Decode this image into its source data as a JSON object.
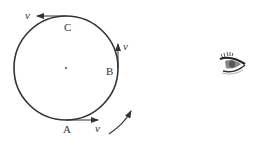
{
  "diagram": {
    "circle": {
      "cx": 66,
      "cy": 68,
      "r": 52,
      "stroke": "#333333"
    },
    "points": [
      {
        "name": "A",
        "label": "A",
        "velocity_label": "v",
        "position": "bottom"
      },
      {
        "name": "B",
        "label": "B",
        "velocity_label": "v",
        "position": "right"
      },
      {
        "name": "C",
        "label": "C",
        "velocity_label": "v",
        "position": "top"
      }
    ],
    "rotation_direction": "counterclockwise",
    "observer": "eye-icon"
  }
}
